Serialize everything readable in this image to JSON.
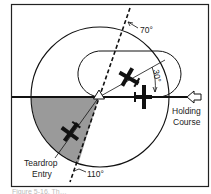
{
  "diagram": {
    "type": "holding-pattern-entry",
    "labels": {
      "angle_top": "70°",
      "angle_bottom": "110°",
      "angle_offset": "30°",
      "holding_course_line1": "Holding",
      "holding_course_line2": "Course",
      "entry_line1": "Teardrop",
      "entry_line2": "Entry"
    },
    "caption": "Figure 5-16. Th…",
    "colors": {
      "stroke": "#111111",
      "shaded_sector": "#9a9a9a",
      "background": "#ffffff",
      "caption": "#bbbbbb"
    },
    "elements": [
      {
        "name": "frame"
      },
      {
        "name": "entry-circle"
      },
      {
        "name": "holding-racetrack"
      },
      {
        "name": "holding-course-line"
      },
      {
        "name": "sector-divider-dashed-line"
      },
      {
        "name": "teardrop-sector-shaded"
      },
      {
        "name": "holding-fix-triangle"
      },
      {
        "name": "inbound-arrow"
      },
      {
        "name": "airplane-teardrop"
      },
      {
        "name": "airplane-outbound-30"
      },
      {
        "name": "airplane-on-course"
      }
    ]
  }
}
